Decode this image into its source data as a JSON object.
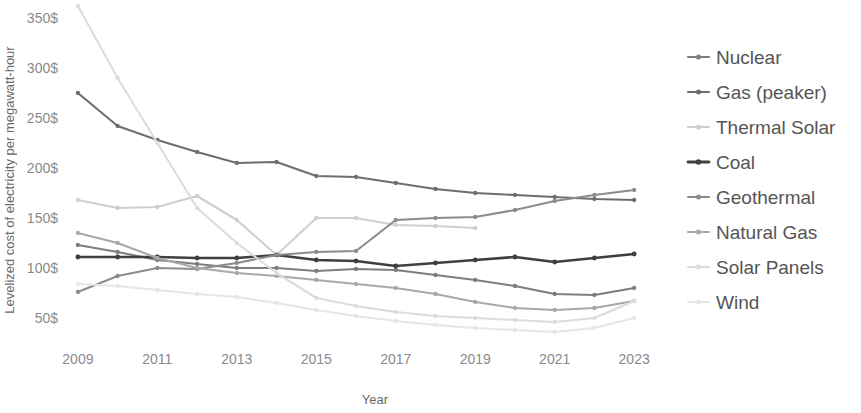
{
  "chart_data": {
    "type": "line",
    "title": "",
    "xlabel": "Year",
    "ylabel": "Levelized cost of electricity per megawatt-hour",
    "x": [
      2009,
      2010,
      2011,
      2012,
      2013,
      2014,
      2015,
      2016,
      2017,
      2018,
      2019,
      2020,
      2021,
      2022,
      2023
    ],
    "xtick_labels": [
      "2009",
      "2011",
      "2013",
      "2015",
      "2017",
      "2019",
      "2021",
      "2023"
    ],
    "xtick_values": [
      2009,
      2011,
      2013,
      2015,
      2017,
      2019,
      2021,
      2023
    ],
    "ytick_labels": [
      "50$",
      "100$",
      "150$",
      "200$",
      "250$",
      "300$",
      "350$"
    ],
    "ytick_values": [
      50,
      100,
      150,
      200,
      250,
      300,
      350
    ],
    "ylim": [
      28,
      360
    ],
    "xlim": [
      2008.6,
      2023.6
    ],
    "grid": false,
    "legend_position": "right",
    "series": [
      {
        "name": "Nuclear",
        "color": "#7d7d7d",
        "values": [
          123,
          116,
          108,
          104,
          100,
          100,
          97,
          99,
          98,
          93,
          88,
          82,
          74,
          73,
          80
        ]
      },
      {
        "name": "Gas (peaker)",
        "color": "#6e6e6e",
        "values": [
          275,
          242,
          228,
          216,
          205,
          206,
          192,
          191,
          185,
          179,
          175,
          173,
          171,
          169,
          168
        ]
      },
      {
        "name": "Thermal Solar",
        "color": "#cfcfcf",
        "values": [
          168,
          160,
          161,
          172,
          148,
          113,
          150,
          150,
          143,
          142,
          140,
          null,
          null,
          null,
          null
        ]
      },
      {
        "name": "Coal",
        "color": "#3f3f3f",
        "values": [
          111,
          111,
          111,
          110,
          110,
          113,
          108,
          107,
          102,
          105,
          108,
          111,
          106,
          110,
          114
        ]
      },
      {
        "name": "Geothermal",
        "color": "#8c8c8c",
        "values": [
          76,
          92,
          100,
          99,
          105,
          113,
          116,
          117,
          148,
          150,
          151,
          158,
          167,
          173,
          178
        ]
      },
      {
        "name": "Natural Gas",
        "color": "#a8a8a8",
        "values": [
          135,
          125,
          110,
          100,
          95,
          92,
          88,
          84,
          80,
          74,
          66,
          60,
          58,
          60,
          67
        ]
      },
      {
        "name": "Solar Panels",
        "color": "#dcdcdc",
        "values": [
          362,
          290,
          225,
          160,
          125,
          95,
          70,
          62,
          56,
          52,
          50,
          48,
          46,
          50,
          67
        ]
      },
      {
        "name": "Wind",
        "color": "#e6e6e6",
        "values": [
          84,
          82,
          78,
          74,
          71,
          65,
          58,
          52,
          47,
          43,
          40,
          38,
          36,
          40,
          50
        ]
      }
    ]
  },
  "legend": {
    "items": [
      {
        "label": "Nuclear"
      },
      {
        "label": "Gas (peaker)"
      },
      {
        "label": "Thermal Solar"
      },
      {
        "label": "Coal"
      },
      {
        "label": "Geothermal"
      },
      {
        "label": "Natural Gas"
      },
      {
        "label": "Solar Panels"
      },
      {
        "label": "Wind"
      }
    ]
  }
}
